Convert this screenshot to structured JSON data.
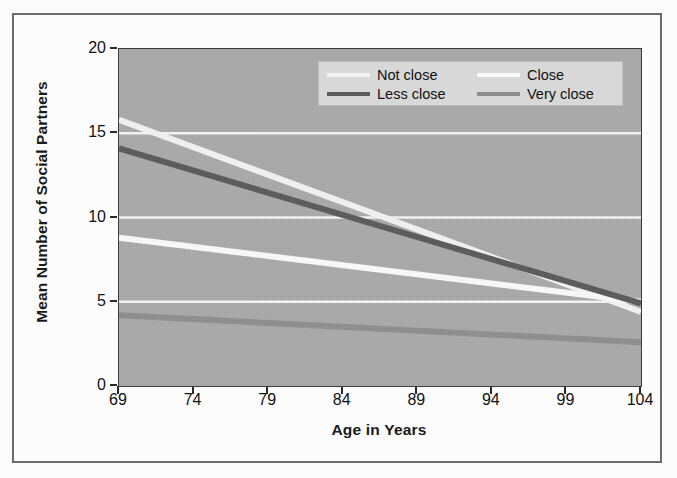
{
  "figure": {
    "background_color": "#fcfcfc",
    "panel_color": "#a9a9a9",
    "frame_color": "#6b6b6b"
  },
  "legend": {
    "background_color": "#d8d8d8",
    "entries": [
      {
        "label": "Not close",
        "color": "#f2f2f2"
      },
      {
        "label": "Close",
        "color": "#fafafa"
      },
      {
        "label": "Less close",
        "color": "#5a5a5a"
      },
      {
        "label": "Very close",
        "color": "#8e8e8e"
      }
    ]
  },
  "chart_data": {
    "type": "line",
    "title": "",
    "xlabel": "Age in Years",
    "ylabel": "Mean Number of Social Partners",
    "x": [
      69,
      74,
      79,
      84,
      89,
      94,
      99,
      104
    ],
    "xticklabels": [
      "69",
      "74",
      "79",
      "84",
      "89",
      "94",
      "99",
      "104"
    ],
    "yticks": [
      0,
      5,
      10,
      15,
      20
    ],
    "yticklabels": [
      "0",
      "5",
      "10",
      "15",
      "20"
    ],
    "xlim": [
      69,
      104
    ],
    "ylim": [
      0,
      20
    ],
    "grid": "horizontal gridlines at 5, 10, 15 (white)",
    "gridline_color": "#f5f5f5",
    "legend_position": "top-right inside axes",
    "series": [
      {
        "name": "Not close",
        "color": "#f2f2f2",
        "endpoints": {
          "x": [
            69,
            104
          ],
          "y": [
            15.8,
            4.4
          ]
        },
        "values": [
          15.8,
          14.2,
          12.5,
          10.9,
          9.3,
          7.6,
          6.0,
          4.4
        ]
      },
      {
        "name": "Less close",
        "color": "#5a5a5a",
        "endpoints": {
          "x": [
            69,
            104
          ],
          "y": [
            14.1,
            4.9
          ]
        },
        "values": [
          14.1,
          12.8,
          11.5,
          10.2,
          8.8,
          7.5,
          6.2,
          4.9
        ]
      },
      {
        "name": "Close",
        "color": "#fafafa",
        "endpoints": {
          "x": [
            69,
            104
          ],
          "y": [
            8.8,
            5.0
          ]
        },
        "values": [
          8.8,
          8.3,
          7.7,
          7.2,
          6.6,
          6.1,
          5.5,
          5.0
        ]
      },
      {
        "name": "Very close",
        "color": "#8e8e8e",
        "endpoints": {
          "x": [
            69,
            104
          ],
          "y": [
            4.2,
            2.6
          ]
        },
        "values": [
          4.2,
          4.0,
          3.7,
          3.5,
          3.3,
          3.0,
          2.8,
          2.6
        ]
      }
    ]
  }
}
